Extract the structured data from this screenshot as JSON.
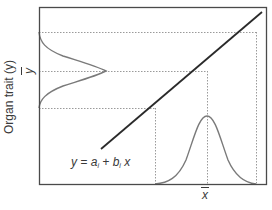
{
  "figure": {
    "y_axis_label": "Organ trait (y)",
    "y_mean_label": "y",
    "x_mean_label": "x",
    "equation": {
      "lhs": "y",
      "equals": " = ",
      "a": "a",
      "a_sub": "i",
      "plus": " + ",
      "b": "b",
      "b_sub": "i",
      "x": " x"
    }
  },
  "colors": {
    "frame": "#4a4a4a",
    "regression_line": "#2a2a2a",
    "distribution_curves": "#7a7a7a",
    "dotted_guides": "#9a9a9a",
    "text": "#3a3a3a"
  },
  "geometry": {
    "frame": {
      "x": 39,
      "y": 7,
      "width": 227,
      "height": 177
    },
    "regression_line": {
      "x1": 101,
      "y1": 149,
      "x2": 262,
      "y2": 12
    },
    "x_distribution": {
      "low": 155,
      "mean": 207,
      "high": 256,
      "peak_y": 116,
      "base_y": 184
    },
    "y_distribution": {
      "low": 108,
      "mean": 71,
      "high": 32,
      "peak_x": 106,
      "base_x": 39
    }
  }
}
